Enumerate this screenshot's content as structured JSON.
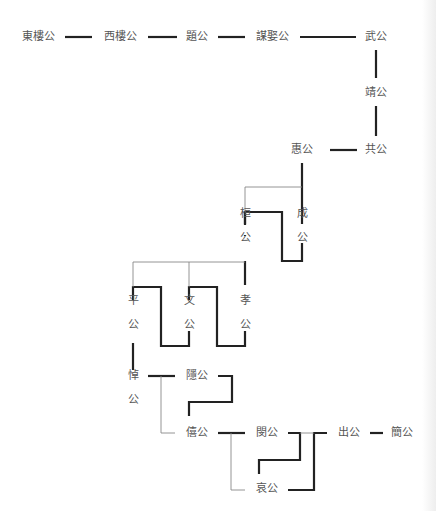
{
  "diagram": {
    "title": "",
    "nodes": {
      "dongloug": "東樓公",
      "xiloug": "西樓公",
      "tig": "題公",
      "moujug": "謀娶公",
      "wug": "武公",
      "jingg": "靖公",
      "gongg": "共公",
      "huig": "惠公",
      "huan": [
        "桓",
        "公"
      ],
      "cheng": [
        "成",
        "公"
      ],
      "ping": [
        "平",
        "公"
      ],
      "wen": [
        "文",
        "公"
      ],
      "xiao": [
        "孝",
        "公"
      ],
      "dao": [
        "悼",
        "公"
      ],
      "yin": "隱公",
      "xi": "僖公",
      "min": "閔公",
      "ai": "哀公",
      "chu": "出公",
      "jian": "簡公"
    },
    "relations": [
      {
        "from": "東樓公",
        "to": "西樓公",
        "type": "succession"
      },
      {
        "from": "西樓公",
        "to": "題公",
        "type": "succession"
      },
      {
        "from": "題公",
        "to": "謀娶公",
        "type": "succession"
      },
      {
        "from": "謀娶公",
        "to": "武公",
        "type": "succession"
      },
      {
        "from": "武公",
        "to": "靖公",
        "type": "succession"
      },
      {
        "from": "靖公",
        "to": "共公",
        "type": "succession"
      },
      {
        "from": "共公",
        "to": "惠公",
        "type": "succession"
      },
      {
        "from": "惠公",
        "to": "成公",
        "type": "parent"
      },
      {
        "from": "惠公",
        "to": "桓公",
        "type": "parent"
      },
      {
        "from": "桓公",
        "to": "成公",
        "type": "succession"
      },
      {
        "from": "成公",
        "to": "孝公",
        "type": "parent"
      },
      {
        "from": "孝公",
        "to": "文公",
        "type": "parent"
      },
      {
        "from": "孝公",
        "to": "平公",
        "type": "parent"
      },
      {
        "from": "平公",
        "to": "文公",
        "type": "succession"
      },
      {
        "from": "文公",
        "to": "孝公",
        "type": "succession"
      },
      {
        "from": "平公",
        "to": "悼公",
        "type": "succession"
      },
      {
        "from": "悼公",
        "to": "隱公",
        "type": "succession"
      },
      {
        "from": "悼公",
        "to": "僖公",
        "type": "parent"
      },
      {
        "from": "隱公",
        "to": "僖公",
        "type": "succession"
      },
      {
        "from": "僖公",
        "to": "閔公",
        "type": "succession"
      },
      {
        "from": "僖公",
        "to": "哀公",
        "type": "parent"
      },
      {
        "from": "閔公",
        "to": "哀公",
        "type": "succession"
      },
      {
        "from": "閔公",
        "to": "出公",
        "type": "parent"
      },
      {
        "from": "哀公",
        "to": "出公",
        "type": "succession"
      },
      {
        "from": "出公",
        "to": "簡公",
        "type": "succession"
      }
    ],
    "colors": {
      "succession_line": "#222222",
      "kinship_line": "#888888",
      "text": "#555555"
    }
  }
}
